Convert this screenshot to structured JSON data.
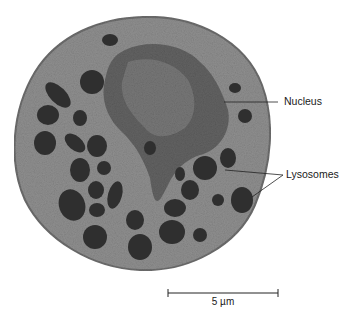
{
  "figure": {
    "type": "electron micrograph"
  },
  "labels": {
    "nucleus": "Nucleus",
    "lysosomes": "Lysosomes"
  },
  "scale_bar": {
    "text": "5 µm"
  },
  "colors": {
    "cytoplasm": "#8a8a8a",
    "nucleus": "#5c5c5c",
    "lysosome": "#2e2e2e",
    "line": "#222222"
  }
}
